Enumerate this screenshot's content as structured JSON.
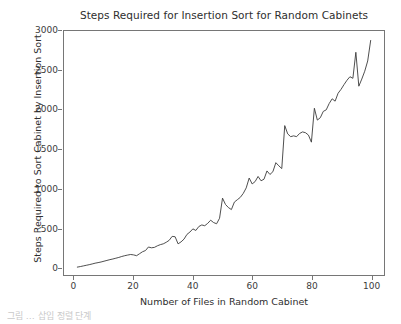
{
  "figure": {
    "background_color": "#ffffff",
    "line_color": "#3b3b3b",
    "spine_color": "#767676",
    "bottom_artifact_text": "그림 … 삽입 정렬 단계"
  },
  "chart_data": {
    "type": "line",
    "title": "Steps Required for Insertion Sort for Random Cabinets",
    "xlabel": "Number of Files in Random Cabinet",
    "ylabel": "Steps Required to Sort Cabinet by Insertion Sort",
    "xlim": [
      -3.5,
      104.5
    ],
    "ylim": [
      -95,
      3000
    ],
    "xticks": [
      0,
      20,
      40,
      60,
      80,
      100
    ],
    "yticks": [
      0,
      500,
      1000,
      1500,
      2000,
      2500,
      3000
    ],
    "grid": false,
    "legend": null,
    "series": [
      {
        "name": "insertion sort steps",
        "color": "#3b3b3b",
        "x": [
          1,
          2,
          3,
          4,
          5,
          6,
          7,
          8,
          9,
          10,
          11,
          12,
          13,
          14,
          15,
          16,
          17,
          18,
          19,
          20,
          21,
          22,
          23,
          24,
          25,
          26,
          27,
          28,
          29,
          30,
          31,
          32,
          33,
          34,
          35,
          36,
          37,
          38,
          39,
          40,
          41,
          42,
          43,
          44,
          45,
          46,
          47,
          48,
          49,
          50,
          51,
          52,
          53,
          54,
          55,
          56,
          57,
          58,
          59,
          60,
          61,
          62,
          63,
          64,
          65,
          66,
          67,
          68,
          69,
          70,
          71,
          72,
          73,
          74,
          75,
          76,
          77,
          78,
          79,
          80,
          81,
          82,
          83,
          84,
          85,
          86,
          87,
          88,
          89,
          90,
          91,
          92,
          93,
          94,
          95,
          96,
          97,
          98,
          99,
          100
        ],
        "values": [
          5,
          12,
          20,
          28,
          36,
          45,
          55,
          62,
          70,
          80,
          90,
          100,
          108,
          118,
          128,
          140,
          150,
          158,
          165,
          160,
          150,
          175,
          200,
          215,
          260,
          250,
          255,
          275,
          290,
          300,
          320,
          345,
          395,
          390,
          300,
          325,
          360,
          420,
          450,
          490,
          470,
          520,
          540,
          530,
          560,
          600,
          570,
          555,
          625,
          880,
          800,
          760,
          735,
          830,
          860,
          890,
          940,
          1010,
          1135,
          1060,
          1090,
          1155,
          1100,
          1120,
          1225,
          1180,
          1215,
          1330,
          1290,
          1255,
          1800,
          1695,
          1660,
          1670,
          1660,
          1700,
          1720,
          1710,
          1680,
          1590,
          2020,
          1870,
          1900,
          1980,
          2000,
          2080,
          2140,
          2110,
          2210,
          2260,
          2320,
          2375,
          2420,
          2400,
          2730,
          2300,
          2390,
          2490,
          2620,
          2880
        ]
      }
    ]
  },
  "ticks": {
    "y": [
      "3000",
      "2500",
      "2000",
      "1500",
      "1000",
      "500",
      "0"
    ],
    "x": [
      "0",
      "20",
      "40",
      "60",
      "80",
      "100"
    ]
  }
}
